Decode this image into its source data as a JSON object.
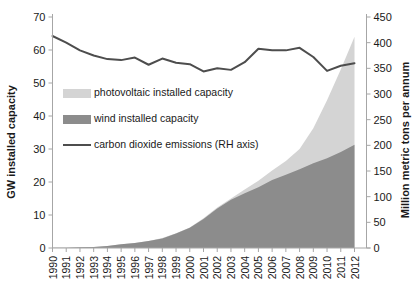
{
  "chart_data": {
    "type": "area",
    "title": "",
    "subtitle": "",
    "xlabel": "",
    "ylabel": "GW installed capacity",
    "y2label": "Million metric tons per annum",
    "grid": false,
    "legend_position": "inside-upper-left",
    "categories": [
      "1990",
      "1991",
      "1992",
      "1993",
      "1994",
      "1995",
      "1996",
      "1997",
      "1998",
      "1999",
      "2000",
      "2001",
      "2002",
      "2003",
      "2004",
      "2005",
      "2006",
      "2007",
      "2008",
      "2009",
      "2010",
      "2011",
      "2012"
    ],
    "ylim": [
      0,
      70
    ],
    "yticks": [
      0,
      10,
      20,
      30,
      40,
      50,
      60,
      70
    ],
    "y2lim": [
      0,
      450
    ],
    "y2ticks": [
      0,
      50,
      100,
      150,
      200,
      250,
      300,
      350,
      400,
      450
    ],
    "series": [
      {
        "name": "wind installed capacity",
        "type": "area",
        "stack": "capacity",
        "axis": "left",
        "color": "#8c8c8c",
        "values": [
          0.1,
          0.1,
          0.2,
          0.3,
          0.6,
          1.1,
          1.5,
          2.1,
          2.9,
          4.4,
          6.1,
          8.8,
          12.0,
          14.6,
          16.6,
          18.4,
          20.6,
          22.2,
          23.9,
          25.7,
          27.2,
          29.1,
          31.3
        ]
      },
      {
        "name": "photovoltaic installed capacity",
        "type": "area",
        "stack": "capacity",
        "axis": "left",
        "color": "#d4d4d4",
        "values": [
          0.0,
          0.0,
          0.0,
          0.0,
          0.0,
          0.0,
          0.0,
          0.0,
          0.1,
          0.1,
          0.1,
          0.2,
          0.3,
          0.4,
          1.1,
          2.0,
          2.9,
          4.2,
          6.1,
          10.6,
          17.6,
          25.0,
          32.7
        ]
      },
      {
        "name": "carbon dioxide emissions (RH axis)",
        "type": "line",
        "axis": "right",
        "color": "#4d4d4d",
        "values": [
          413,
          400,
          385,
          375,
          368,
          366,
          371,
          357,
          369,
          361,
          358,
          344,
          350,
          347,
          362,
          388,
          385,
          385,
          390,
          372,
          345,
          355,
          360
        ]
      }
    ],
    "legend": [
      {
        "label": "photovoltaic installed capacity",
        "swatch": "#d4d4d4",
        "style": "box"
      },
      {
        "label": "wind installed capacity",
        "swatch": "#8c8c8c",
        "style": "box"
      },
      {
        "label": "carbon dioxide emissions (RH axis)",
        "swatch": "#4d4d4d",
        "style": "line"
      }
    ]
  }
}
